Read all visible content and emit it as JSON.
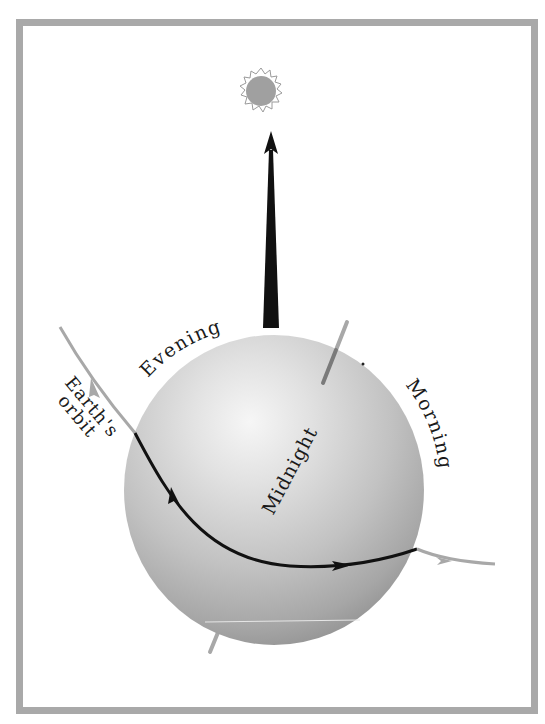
{
  "figure": {
    "labels": {
      "evening": "Evening",
      "morning": "Morning",
      "midnight": "Midnight",
      "earths": "Earth's",
      "orbit": "orbit"
    },
    "icons": {
      "sun": "sun-icon",
      "sun_direction_arrow": "arrow-up-icon"
    },
    "colors": {
      "frame": "#a9a9a9",
      "sun_fill": "#a0a0a0",
      "sun_rays": "#9a9a9a",
      "sphere_highlight": "#f4f4f4",
      "sphere_mid": "#c4c4c4",
      "sphere_edge": "#8f8f8f",
      "orbit_outside": "#a8a8a8",
      "orbit_on_earth": "#111111",
      "arrow": "#111111",
      "axis": "#9c9c9c"
    }
  }
}
